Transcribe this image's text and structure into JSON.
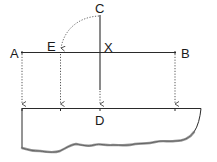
{
  "diagram": {
    "labels": {
      "A": "A",
      "B": "B",
      "C": "C",
      "D": "D",
      "E": "E",
      "X": "X"
    },
    "colors": {
      "line": "#2a2a2a",
      "dotted": "#444444",
      "torn_edge": "#555555",
      "background": "#ffffff"
    },
    "elements": [
      {
        "type": "solid-line",
        "from": "A",
        "to": "B",
        "desc": "horizontal line AB"
      },
      {
        "type": "solid-line",
        "from": "C",
        "to": "D",
        "desc": "vertical line from C through X toward D"
      },
      {
        "type": "dotted-arc",
        "from": "C",
        "to": "E",
        "desc": "arc showing XC swung to E"
      },
      {
        "type": "dotted-arrow",
        "from": "A",
        "to": "base",
        "desc": "projection of A"
      },
      {
        "type": "dotted-arrow",
        "from": "E",
        "to": "base",
        "desc": "projection of E"
      },
      {
        "type": "dotted-arrow",
        "from": "X",
        "to": "D",
        "desc": "projection of X to D"
      },
      {
        "type": "dotted-arrow",
        "from": "B",
        "to": "base",
        "desc": "projection of B"
      },
      {
        "type": "shape",
        "desc": "sheet with torn bottom edge"
      }
    ]
  }
}
